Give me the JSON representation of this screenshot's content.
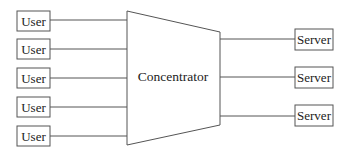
{
  "diagram": {
    "center_node": {
      "label": "Concentrator",
      "shape": "trapezoid"
    },
    "users": [
      {
        "label": "User"
      },
      {
        "label": "User"
      },
      {
        "label": "User"
      },
      {
        "label": "User"
      },
      {
        "label": "User"
      }
    ],
    "servers": [
      {
        "label": "Server"
      },
      {
        "label": "Server"
      },
      {
        "label": "Server"
      }
    ],
    "colors": {
      "stroke": "#555555",
      "text": "#222222",
      "background": "#ffffff"
    }
  }
}
